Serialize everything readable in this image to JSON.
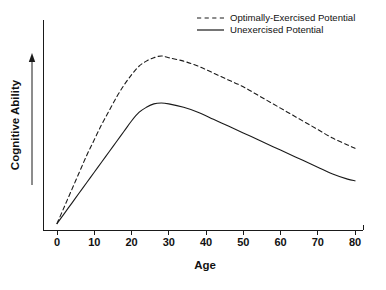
{
  "chart_data": {
    "type": "line",
    "title": "",
    "xlabel": "Age",
    "ylabel": "Cognitive Ability",
    "xlim": [
      0,
      80
    ],
    "ylim": [
      0,
      100
    ],
    "grid": false,
    "legend_position": "top-right",
    "xticks": [
      0,
      10,
      20,
      30,
      40,
      50,
      60,
      70,
      80
    ],
    "xtick_labels": [
      "0",
      "10",
      "20",
      "30",
      "40",
      "50",
      "60",
      "70",
      "80"
    ],
    "yticks": [],
    "ytick_labels": [],
    "y_axis_arrow": true,
    "series": [
      {
        "name": "Optimally-Exercised Potential",
        "style": "dashed",
        "color": "#1a1a1a",
        "x": [
          0,
          2,
          4,
          6,
          8,
          10,
          12,
          14,
          16,
          18,
          20,
          22,
          24,
          26,
          28,
          30,
          34,
          38,
          42,
          46,
          50,
          54,
          58,
          62,
          66,
          70,
          74,
          78,
          80
        ],
        "y": [
          2,
          12,
          22,
          32,
          42,
          51,
          60,
          68,
          76,
          83,
          89,
          94,
          97,
          99,
          100,
          99,
          97,
          94,
          90,
          86,
          82,
          77,
          72,
          67,
          62,
          57,
          52,
          48,
          46
        ]
      },
      {
        "name": "Unexercised Potential",
        "style": "solid",
        "color": "#1a1a1a",
        "x": [
          0,
          2,
          4,
          6,
          8,
          10,
          12,
          14,
          16,
          18,
          20,
          22,
          24,
          26,
          28,
          30,
          34,
          38,
          42,
          46,
          50,
          54,
          58,
          62,
          66,
          70,
          74,
          78,
          80
        ],
        "y": [
          2,
          8,
          14,
          20,
          26,
          32,
          38,
          44,
          50,
          56,
          62,
          67,
          70,
          72,
          72.5,
          72,
          70,
          67,
          63,
          59,
          55,
          51,
          47,
          43,
          39,
          35,
          31,
          28,
          27
        ]
      }
    ],
    "legend": [
      {
        "label": "Optimally-Exercised Potential",
        "style": "dashed"
      },
      {
        "label": "Unexercised Potential",
        "style": "solid"
      }
    ]
  },
  "geometry": {
    "width": 386,
    "height": 290,
    "plot_left": 57,
    "plot_right": 355,
    "plot_bottom": 227,
    "plot_top": 56,
    "axis_x_left": 43,
    "axis_x_right": 363,
    "axis_baseline_y": 230,
    "axis_y_top": 20,
    "tick_length": 5,
    "tick_label_y": 243,
    "xlabel_x": 205,
    "xlabel_y": 266,
    "ylabel_x": 16,
    "ylabel_y": 125,
    "arrow_x": 32,
    "arrow_y_bottom": 185,
    "arrow_y_top": 53,
    "legend_line_x1": 197,
    "legend_line_x2": 224,
    "legend_text_x": 230,
    "legend_row1_y": 18,
    "legend_row2_y": 30
  }
}
